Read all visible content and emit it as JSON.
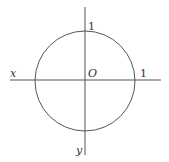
{
  "diagram": {
    "type": "unit-circle",
    "colors": {
      "stroke": "#555555",
      "text": "#333333",
      "background": "#ffffff"
    },
    "labels": {
      "y_axis_top_tick": "1",
      "x_axis_name": "x",
      "origin": "O",
      "x_axis_right_tick": "1",
      "y_axis_name": "y"
    }
  }
}
